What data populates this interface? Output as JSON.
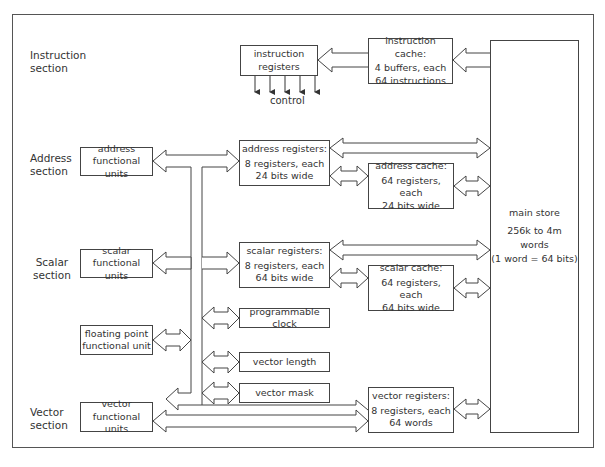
{
  "sections": {
    "instruction": "Instruction\nsection",
    "address": "Address\nsection",
    "scalar": "Scalar\nsection",
    "vector": "Vector\nsection"
  },
  "functional_units": {
    "address": "address\nfunctional units",
    "scalar": "scalar\nfunctional units",
    "floating_point": "floating point\nfunctional unit",
    "vector": "vector\nfunctional units"
  },
  "instruction_registers": {
    "label": "instruction\nregisters",
    "control_label": "control",
    "control_lines": 5
  },
  "instruction_cache": {
    "title": "instruction cache:",
    "body": "4 buffers, each\n64 instructions"
  },
  "address_registers": {
    "title": "address registers:",
    "body": "8 registers, each\n24 bits wide"
  },
  "address_cache": {
    "title": "address cache:",
    "body": "64 registers, each\n24 bits wide"
  },
  "scalar_registers": {
    "title": "scalar registers:",
    "body": "8 registers, each\n64 bits wide"
  },
  "scalar_cache": {
    "title": "scalar cache:",
    "body": "64 registers, each\n64 bits wide"
  },
  "programmable_clock": "programmable clock",
  "vector_length": "vector length",
  "vector_mask": "vector mask",
  "vector_registers": {
    "title": "vector registers:",
    "body": "8 registers, each\n64 words"
  },
  "main_store": {
    "title": "main store",
    "body": "256k to 4m\nwords\n(1 word = 64 bits)"
  },
  "colors": {
    "line": "#444444",
    "background": "#ffffff",
    "text": "#333333"
  }
}
